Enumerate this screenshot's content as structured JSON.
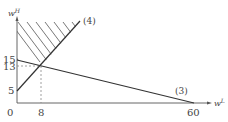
{
  "diagram": {
    "type": "linear-constraints-plot",
    "axes": {
      "x_label": "w",
      "x_label_sup": "L",
      "y_label": "w",
      "y_label_sup": "H",
      "origin_label": "0"
    },
    "x_ticks": [
      {
        "value": 8,
        "label": "8"
      },
      {
        "value": 60,
        "label": "60"
      }
    ],
    "y_ticks": [
      {
        "value": 5,
        "label": "5"
      },
      {
        "value": 13,
        "label": "13"
      },
      {
        "value": 15,
        "label": "15"
      }
    ],
    "lines": [
      {
        "id": "3",
        "label": "(3)",
        "from": [
          0,
          15
        ],
        "to": [
          60,
          0
        ]
      },
      {
        "id": "4",
        "label": "(4)",
        "from": [
          0,
          5
        ],
        "through": [
          8,
          13
        ]
      }
    ],
    "intersection": {
      "x": 8,
      "y": 13
    },
    "shaded_region": "above line (4), right of w^H axis",
    "colors": {
      "line": "#333333",
      "axis": "#555555",
      "dashed": "#888888",
      "text": "#444444"
    }
  }
}
